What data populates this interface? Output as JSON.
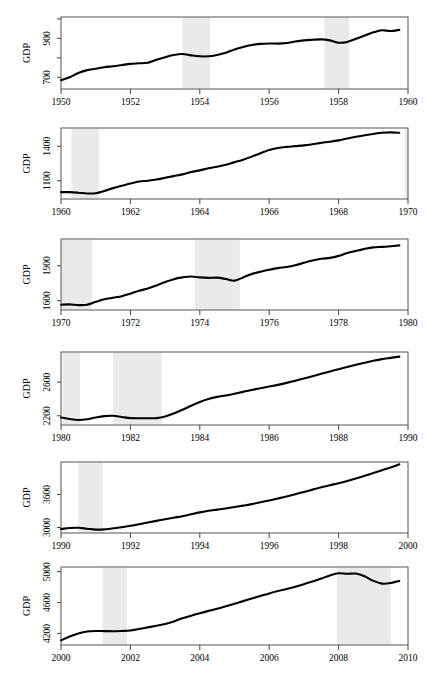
{
  "figure": {
    "width": 426,
    "height": 680,
    "panel_count": 6,
    "y_axis_title": "GDP",
    "recession_band_color": "#eaeaea",
    "line_color": "#000000",
    "background_color": "#ffffff"
  },
  "chart_data": [
    {
      "type": "line",
      "title": "",
      "xlabel": "",
      "ylabel": "GDP",
      "grid": false,
      "legend": null,
      "xlim": [
        1950,
        1960
      ],
      "ylim": [
        640,
        1010
      ],
      "xticks": [
        1950,
        1952,
        1954,
        1956,
        1958,
        1960
      ],
      "xticklabels": [
        "1950",
        "1952",
        "1954",
        "1956",
        "1958",
        "1960"
      ],
      "yticks": [
        700,
        800,
        900,
        1000
      ],
      "yticklabels": [
        "700",
        "",
        "900",
        ""
      ],
      "annotations": [
        {
          "type": "recession_band",
          "start": 1953.5,
          "end": 1954.3
        },
        {
          "type": "recession_band",
          "start": 1957.6,
          "end": 1958.3
        }
      ],
      "x": [
        1950.0,
        1950.25,
        1950.5,
        1950.75,
        1951.0,
        1951.25,
        1951.5,
        1951.75,
        1952.0,
        1952.25,
        1952.5,
        1952.75,
        1953.0,
        1953.25,
        1953.5,
        1953.75,
        1954.0,
        1954.25,
        1954.5,
        1954.75,
        1955.0,
        1955.25,
        1955.5,
        1955.75,
        1956.0,
        1956.25,
        1956.5,
        1956.75,
        1957.0,
        1957.25,
        1957.5,
        1957.75,
        1958.0,
        1958.25,
        1958.5,
        1958.75,
        1959.0,
        1959.25,
        1959.5,
        1959.75
      ],
      "y": [
        685,
        700,
        722,
        737,
        744,
        752,
        757,
        763,
        769,
        772,
        775,
        790,
        803,
        815,
        820,
        813,
        808,
        808,
        815,
        826,
        843,
        856,
        866,
        872,
        874,
        873,
        876,
        884,
        890,
        893,
        895,
        890,
        878,
        882,
        898,
        915,
        931,
        942,
        938,
        944
      ]
    },
    {
      "type": "line",
      "title": "",
      "xlabel": "",
      "ylabel": "GDP",
      "grid": false,
      "legend": null,
      "xlim": [
        1960,
        1970
      ],
      "ylim": [
        940,
        1560
      ],
      "xticks": [
        1960,
        1962,
        1964,
        1966,
        1968,
        1970
      ],
      "xticklabels": [
        "1960",
        "1962",
        "1964",
        "1966",
        "1968",
        "1970"
      ],
      "yticks": [
        1100,
        1400
      ],
      "yticklabels": [
        "1100",
        "1400"
      ],
      "annotations": [
        {
          "type": "recession_band",
          "start": 1960.3,
          "end": 1961.1
        },
        {
          "type": "recession_band",
          "start": 1969.9,
          "end": 1970.0
        }
      ],
      "x": [
        1960.0,
        1960.25,
        1960.5,
        1960.75,
        1961.0,
        1961.25,
        1961.5,
        1961.75,
        1962.0,
        1962.25,
        1962.5,
        1962.75,
        1963.0,
        1963.25,
        1963.5,
        1963.75,
        1964.0,
        1964.25,
        1964.5,
        1964.75,
        1965.0,
        1965.25,
        1965.5,
        1965.75,
        1966.0,
        1966.25,
        1966.5,
        1966.75,
        1967.0,
        1967.25,
        1967.5,
        1967.75,
        1968.0,
        1968.25,
        1968.5,
        1968.75,
        1969.0,
        1969.25,
        1969.5,
        1969.75
      ],
      "y": [
        1000,
        1000,
        995,
        988,
        990,
        1010,
        1035,
        1055,
        1075,
        1093,
        1100,
        1110,
        1125,
        1140,
        1155,
        1175,
        1190,
        1208,
        1222,
        1240,
        1262,
        1283,
        1310,
        1340,
        1368,
        1385,
        1395,
        1402,
        1408,
        1418,
        1430,
        1440,
        1452,
        1468,
        1483,
        1496,
        1508,
        1518,
        1522,
        1518
      ]
    },
    {
      "type": "line",
      "title": "",
      "xlabel": "",
      "ylabel": "GDP",
      "grid": false,
      "legend": null,
      "xlim": [
        1970,
        1980
      ],
      "ylim": [
        1520,
        2130
      ],
      "xticks": [
        1970,
        1972,
        1974,
        1976,
        1978,
        1980
      ],
      "xticklabels": [
        "1970",
        "1972",
        "1974",
        "1976",
        "1978",
        "1980"
      ],
      "yticks": [
        1600,
        1900
      ],
      "yticklabels": [
        "1600",
        "1900"
      ],
      "annotations": [
        {
          "type": "recession_band",
          "start": 1970.0,
          "end": 1970.9
        },
        {
          "type": "recession_band",
          "start": 1973.85,
          "end": 1975.15
        }
      ],
      "x": [
        1970.0,
        1970.25,
        1970.5,
        1970.75,
        1971.0,
        1971.25,
        1971.5,
        1971.75,
        1972.0,
        1972.25,
        1972.5,
        1972.75,
        1973.0,
        1973.25,
        1973.5,
        1973.75,
        1974.0,
        1974.25,
        1974.5,
        1974.75,
        1975.0,
        1975.25,
        1975.5,
        1975.75,
        1976.0,
        1976.25,
        1976.5,
        1976.75,
        1977.0,
        1977.25,
        1977.5,
        1977.75,
        1978.0,
        1978.25,
        1978.5,
        1978.75,
        1979.0,
        1979.25,
        1979.5,
        1979.75
      ],
      "y": [
        1565,
        1568,
        1562,
        1565,
        1590,
        1612,
        1625,
        1638,
        1660,
        1685,
        1705,
        1730,
        1760,
        1785,
        1800,
        1808,
        1800,
        1796,
        1798,
        1786,
        1772,
        1800,
        1830,
        1848,
        1865,
        1880,
        1890,
        1905,
        1925,
        1945,
        1960,
        1968,
        1985,
        2010,
        2028,
        2045,
        2058,
        2062,
        2068,
        2075
      ]
    },
    {
      "type": "line",
      "title": "",
      "xlabel": "",
      "ylabel": "GDP",
      "grid": false,
      "legend": null,
      "xlim": [
        1980,
        1990
      ],
      "ylim": [
        2090,
        2960
      ],
      "xticks": [
        1980,
        1982,
        1984,
        1986,
        1988,
        1990
      ],
      "xticklabels": [
        "1980",
        "1982",
        "1984",
        "1986",
        "1988",
        "1990"
      ],
      "yticks": [
        2200,
        2600
      ],
      "yticklabels": [
        "2200",
        "2600"
      ],
      "annotations": [
        {
          "type": "recession_band",
          "start": 1980.05,
          "end": 1980.55
        },
        {
          "type": "recession_band",
          "start": 1981.5,
          "end": 1982.9
        }
      ],
      "x": [
        1980.0,
        1980.25,
        1980.5,
        1980.75,
        1981.0,
        1981.25,
        1981.5,
        1981.75,
        1982.0,
        1982.25,
        1982.5,
        1982.75,
        1983.0,
        1983.25,
        1983.5,
        1983.75,
        1984.0,
        1984.25,
        1984.5,
        1984.75,
        1985.0,
        1985.25,
        1985.5,
        1985.75,
        1986.0,
        1986.25,
        1986.5,
        1986.75,
        1987.0,
        1987.25,
        1987.5,
        1987.75,
        1988.0,
        1988.25,
        1988.5,
        1988.75,
        1989.0,
        1989.25,
        1989.5,
        1989.75
      ],
      "y": [
        2180,
        2162,
        2150,
        2158,
        2180,
        2196,
        2200,
        2186,
        2172,
        2170,
        2170,
        2172,
        2190,
        2228,
        2272,
        2320,
        2365,
        2400,
        2425,
        2442,
        2462,
        2485,
        2508,
        2528,
        2548,
        2568,
        2592,
        2618,
        2645,
        2672,
        2700,
        2728,
        2755,
        2782,
        2808,
        2832,
        2855,
        2875,
        2890,
        2905
      ]
    },
    {
      "type": "line",
      "title": "",
      "xlabel": "",
      "ylabel": "GDP",
      "grid": false,
      "legend": null,
      "xlim": [
        1990,
        2000
      ],
      "ylim": [
        2900,
        4190
      ],
      "xticks": [
        1990,
        1992,
        1994,
        1996,
        1998,
        2000
      ],
      "xticklabels": [
        "1990",
        "1992",
        "1994",
        "1996",
        "1998",
        "2000"
      ],
      "yticks": [
        3000,
        3600
      ],
      "yticklabels": [
        "3000",
        "3600"
      ],
      "annotations": [
        {
          "type": "recession_band",
          "start": 1990.5,
          "end": 1991.2
        }
      ],
      "x": [
        1990.0,
        1990.25,
        1990.5,
        1990.75,
        1991.0,
        1991.25,
        1991.5,
        1991.75,
        1992.0,
        1992.25,
        1992.5,
        1992.75,
        1993.0,
        1993.25,
        1993.5,
        1993.75,
        1994.0,
        1994.25,
        1994.5,
        1994.75,
        1995.0,
        1995.25,
        1995.5,
        1995.75,
        1996.0,
        1996.25,
        1996.5,
        1996.75,
        1997.0,
        1997.25,
        1997.5,
        1997.75,
        1998.0,
        1998.25,
        1998.5,
        1998.75,
        1999.0,
        1999.25,
        1999.5,
        1999.75
      ],
      "y": [
        2972,
        2990,
        2995,
        2978,
        2962,
        2965,
        2985,
        3005,
        3030,
        3060,
        3090,
        3120,
        3150,
        3178,
        3205,
        3240,
        3275,
        3305,
        3325,
        3345,
        3372,
        3398,
        3425,
        3458,
        3492,
        3528,
        3565,
        3605,
        3645,
        3688,
        3730,
        3768,
        3805,
        3845,
        3890,
        3940,
        3990,
        4040,
        4090,
        4148
      ]
    },
    {
      "type": "line",
      "title": "",
      "xlabel": "",
      "ylabel": "GDP",
      "grid": false,
      "legend": null,
      "xlim": [
        2000,
        2010
      ],
      "ylim": [
        4050,
        5060
      ],
      "xticks": [
        2000,
        2002,
        2004,
        2006,
        2008,
        2010
      ],
      "xticklabels": [
        "2000",
        "2002",
        "2004",
        "2006",
        "2008",
        "2010"
      ],
      "yticks": [
        4200,
        4600,
        5000
      ],
      "yticklabels": [
        "4200",
        "4600",
        "5000"
      ],
      "annotations": [
        {
          "type": "recession_band",
          "start": 2001.2,
          "end": 2001.9
        },
        {
          "type": "recession_band",
          "start": 2007.95,
          "end": 2009.5
        }
      ],
      "x": [
        2000.0,
        2000.25,
        2000.5,
        2000.75,
        2001.0,
        2001.25,
        2001.5,
        2001.75,
        2002.0,
        2002.25,
        2002.5,
        2002.75,
        2003.0,
        2003.25,
        2003.5,
        2003.75,
        2004.0,
        2004.25,
        2004.5,
        2004.75,
        2005.0,
        2005.25,
        2005.5,
        2005.75,
        2006.0,
        2006.25,
        2006.5,
        2006.75,
        2007.0,
        2007.25,
        2007.5,
        2007.75,
        2008.0,
        2008.25,
        2008.5,
        2008.75,
        2009.0,
        2009.25,
        2009.5,
        2009.75
      ],
      "y": [
        4110,
        4160,
        4200,
        4225,
        4232,
        4230,
        4228,
        4232,
        4238,
        4258,
        4278,
        4300,
        4322,
        4355,
        4395,
        4430,
        4462,
        4492,
        4520,
        4552,
        4585,
        4618,
        4652,
        4685,
        4718,
        4748,
        4775,
        4805,
        4838,
        4872,
        4910,
        4950,
        4978,
        4972,
        4975,
        4940,
        4880,
        4845,
        4852,
        4880
      ]
    }
  ]
}
